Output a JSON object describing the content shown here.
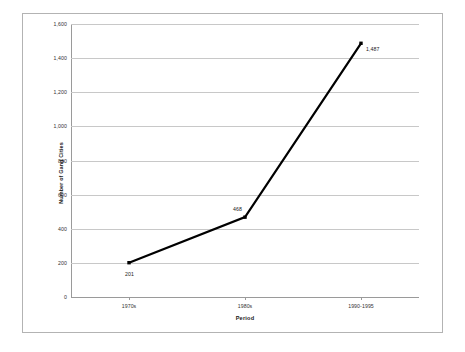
{
  "chart_data": {
    "type": "line",
    "title": "",
    "subtitle": "",
    "xlabel": "Period",
    "ylabel": "Number of Gang Cities",
    "categories": [
      "1970s",
      "1980s",
      "1990-1995"
    ],
    "values": [
      201,
      468,
      1487
    ],
    "point_labels": [
      "201",
      "468",
      "1,487"
    ],
    "series": [
      {
        "name": "Number of Gang Cities",
        "values": [
          201,
          468,
          1487
        ]
      }
    ],
    "ylim": [
      0,
      1600
    ],
    "ytick_step": 200,
    "ytick_labels": [
      "1,600",
      "1,400",
      "1,200",
      "1,000",
      "800",
      "600",
      "400",
      "200",
      "0"
    ],
    "ytick_values": [
      1600,
      1400,
      1200,
      1000,
      800,
      600,
      400,
      200,
      0
    ],
    "grid": true,
    "legend": false,
    "legend_position": "none",
    "line_color": "#000000",
    "marker_color": "#000000",
    "gridline_color": "#c8c8c8",
    "axis_color": "#9a9a9a",
    "border_color": "#b3b3b3",
    "background_color": "#ffffff"
  }
}
